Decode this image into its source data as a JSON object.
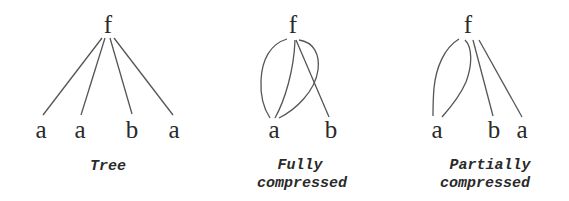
{
  "diagrams": [
    {
      "id": "tree",
      "caption": [
        "Tree"
      ],
      "root": "f",
      "leaves": [
        "a",
        "a",
        "b",
        "a"
      ],
      "edges": [
        {
          "from": "f",
          "to": "a (1)",
          "shape": "straight"
        },
        {
          "from": "f",
          "to": "a (2)",
          "shape": "straight"
        },
        {
          "from": "f",
          "to": "b",
          "shape": "straight"
        },
        {
          "from": "f",
          "to": "a (3)",
          "shape": "straight"
        }
      ]
    },
    {
      "id": "fully-compressed",
      "caption": [
        "Fully",
        "compressed"
      ],
      "root": "f",
      "leaves": [
        "a",
        "b"
      ],
      "edges": [
        {
          "from": "f",
          "to": "a",
          "shape": "curve-left"
        },
        {
          "from": "f",
          "to": "a",
          "shape": "straight"
        },
        {
          "from": "f",
          "to": "a",
          "shape": "curve-right"
        },
        {
          "from": "f",
          "to": "b",
          "shape": "straight"
        }
      ]
    },
    {
      "id": "partially-compressed",
      "caption": [
        "Partially",
        "compressed"
      ],
      "root": "f",
      "leaves": [
        "a",
        "b",
        "a"
      ],
      "edges": [
        {
          "from": "f",
          "to": "a (1)",
          "shape": "curve-left"
        },
        {
          "from": "f",
          "to": "a (1)",
          "shape": "curve-right"
        },
        {
          "from": "f",
          "to": "b",
          "shape": "straight"
        },
        {
          "from": "f",
          "to": "a (2)",
          "shape": "straight"
        }
      ]
    }
  ],
  "colors": {
    "background": "#ffffff",
    "text": "#2a2a2a",
    "edge": "#555555"
  }
}
